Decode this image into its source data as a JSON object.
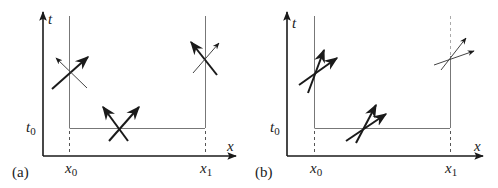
{
  "figure": {
    "panels": [
      {
        "id": "a",
        "label": "(a)",
        "axes": {
          "t_label": "t",
          "x_label": "x"
        },
        "marks": {
          "t0": "t",
          "t0_sub": "0",
          "x0": "x",
          "x0_sub": "0",
          "x1": "x",
          "x1_sub": "1"
        },
        "description": "Characteristic crossings: both directions of same strength on boundaries and at initial line"
      },
      {
        "id": "b",
        "label": "(b)",
        "axes": {
          "t_label": "t",
          "x_label": "x"
        },
        "marks": {
          "t0": "t",
          "t0_sub": "0",
          "x0": "x",
          "x0_sub": "0",
          "x1": "x",
          "x1_sub": "1"
        },
        "description": "Characteristics both moving right; outflow boundary at x1 shown with thin arrows"
      }
    ]
  }
}
